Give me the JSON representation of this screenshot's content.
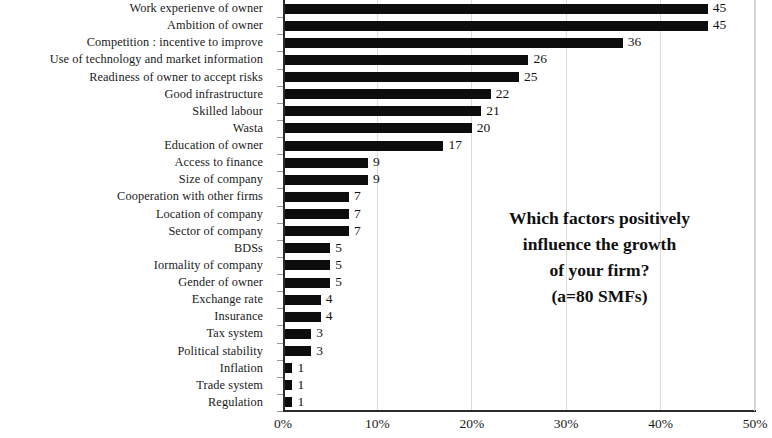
{
  "chart_data": {
    "type": "bar",
    "orientation": "horizontal",
    "title": "",
    "subtitle": "",
    "xlabel": "",
    "ylabel": "",
    "xlim": [
      0,
      50
    ],
    "xunit": "%",
    "grid": true,
    "legend": "none",
    "xticks": [
      "0%",
      "10%",
      "20%",
      "30%",
      "40%",
      "50%"
    ],
    "xtick_values": [
      0,
      10,
      20,
      30,
      40,
      50
    ],
    "bar_color": "#0d0d0d",
    "categories": [
      "Work experienve of owner",
      "Ambition of owner",
      "Competition : incentive to improve",
      "Use of technology and market information",
      "Readiness of owner to accept risks",
      "Good infrastructure",
      "Skilled labour",
      "Wasta",
      "Education of owner",
      "Access to finance",
      "Size of company",
      "Cooperation with other firms",
      "Location of company",
      "Sector of company",
      "BDSs",
      "Iormality of company",
      "Gender of owner",
      "Exchange rate",
      "Insurance",
      "Tax system",
      "Political stability",
      "Inflation",
      "Trade system",
      "Regulation"
    ],
    "values": [
      45,
      45,
      36,
      26,
      25,
      22,
      21,
      20,
      17,
      9,
      9,
      7,
      7,
      7,
      5,
      5,
      5,
      4,
      4,
      3,
      3,
      1,
      1,
      1
    ],
    "value_labels": [
      "45",
      "45",
      "36",
      "26",
      "25",
      "22",
      "21",
      "20",
      "17",
      "9",
      "9",
      "7",
      "7",
      "7",
      "5",
      "5",
      "5",
      "4",
      "4",
      "3",
      "3",
      "1",
      "1",
      "1"
    ],
    "annotation": {
      "lines": [
        "Which factors positively",
        "influence the growth",
        "of your firm?",
        "(a=80 SMFs)"
      ]
    }
  }
}
